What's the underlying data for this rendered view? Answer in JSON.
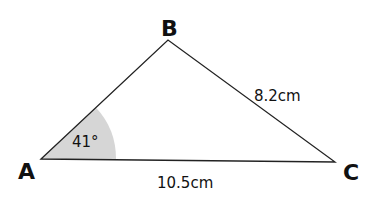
{
  "diagram": {
    "type": "triangle",
    "vertices": {
      "A": {
        "label": "A",
        "x": 41,
        "y": 159
      },
      "B": {
        "label": "B",
        "x": 168,
        "y": 40
      },
      "C": {
        "label": "C",
        "x": 335,
        "y": 162
      }
    },
    "sides": {
      "BC": {
        "label": "8.2cm"
      },
      "AC": {
        "label": "10.5cm"
      }
    },
    "angles": {
      "A": {
        "label": "41°",
        "fill": "#d6d6d6"
      }
    },
    "stroke_color": "#222222"
  }
}
